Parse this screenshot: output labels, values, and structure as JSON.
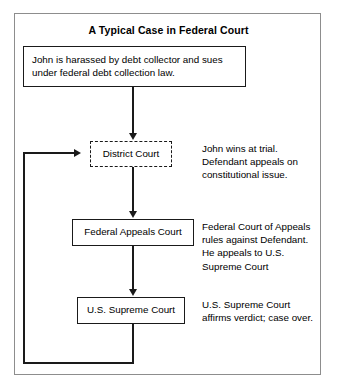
{
  "diagram": {
    "title": "A Typical Case in Federal Court",
    "frame_color": "#8d8d8d",
    "line_color": "#1a1a1a",
    "background": "#ffffff"
  },
  "nodes": {
    "intro": {
      "line1": "John is harassed by debt collector and sues",
      "line2": "under federal debt collection law.",
      "border_style": "solid"
    },
    "district_court": {
      "label": "District Court",
      "border_style": "dashed"
    },
    "federal_appeals_court": {
      "label": "Federal Appeals Court",
      "border_style": "solid"
    },
    "supreme_court": {
      "label": "U.S. Supreme Court",
      "border_style": "solid"
    }
  },
  "notes": {
    "district": "John wins at trial. Defendant appeals on constitutional issue.",
    "appeals": "Federal Court of Appeals rules against Defendant. He appeals to U.S. Supreme Court",
    "supreme": "U.S. Supreme Court affirms verdict; case over."
  }
}
